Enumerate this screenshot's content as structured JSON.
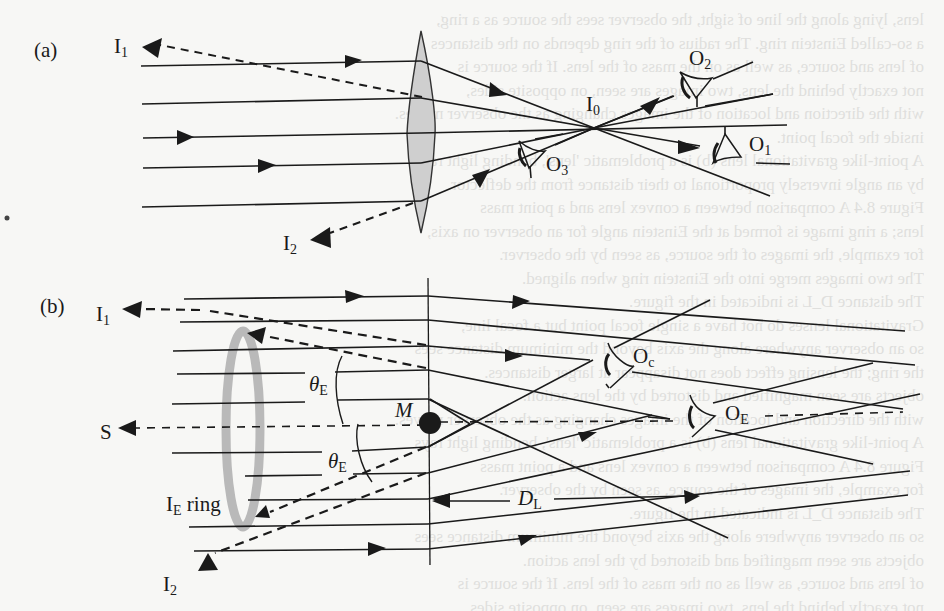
{
  "panels": [
    {
      "id": "a",
      "label": "(a)",
      "description": "Convex lens focusing parallel rays to image point I0; observers O1, O2, O3 placed at different positions",
      "labels": {
        "image_1": "I",
        "image_1_sub": "1",
        "image_2": "I",
        "image_2_sub": "2",
        "focus": "I",
        "focus_sub": "0",
        "observer_1": "O",
        "observer_1_sub": "1",
        "observer_2": "O",
        "observer_2_sub": "2",
        "observer_3": "O",
        "observer_3_sub": "3"
      }
    },
    {
      "id": "b",
      "label": "(b)",
      "description": "Gravitational lens by point mass M forming Einstein ring; observers Oc and OE",
      "labels": {
        "image_1": "I",
        "image_1_sub": "1",
        "image_2": "I",
        "image_2_sub": "2",
        "source": "S",
        "mass": "M",
        "theta_upper": "θ",
        "theta_upper_sub": "E",
        "theta_lower": "θ",
        "theta_lower_sub": "E",
        "ring": "I",
        "ring_sub": "E",
        "ring_word": "ring",
        "observer_c": "O",
        "observer_c_sub": "c",
        "observer_e": "O",
        "observer_e_sub": "E",
        "distance": "D",
        "distance_sub": "L"
      }
    }
  ],
  "colors": {
    "ink": "#1a1a1a",
    "lens_fill": "#cfcfcf",
    "ring": "#b9b9b9",
    "background": "#f7f7f5"
  },
  "bleed_through_text": [
    "lens, lying along the line of sight, the observer sees the source as a ring,",
    "a so-called Einstein ring. The radius of the ring depends on the distances",
    "of lens and source, as well as on the mass of the lens. If the source is",
    "not exactly behind the lens, two images are seen, on opposite sides,",
    "with the direction and location of the images changing as the observer moves.",
    "inside the focal point.",
    "A point-like gravitational lens (b) is a problematic 'lens', bending light rays",
    "by an angle inversely proportional to their distance from the deflector.",
    "Figure 8.4 A comparison between a convex lens and a point mass",
    "lens; a ring image is formed at the Einstein angle for an observer on axis,",
    "for example, the images of the source, as seen by the observer.",
    "The two images merge into the Einstein ring when aligned.",
    "The distance D_L is indicated in the figure.",
    "Gravitational lenses do not have a single focal point but a focal line,",
    "so an observer anywhere along the axis beyond the minimum distance sees",
    "the ring; the lensing effect does not disappear at larger distances.",
    "objects are seen magnified and distorted by the lens action."
  ]
}
